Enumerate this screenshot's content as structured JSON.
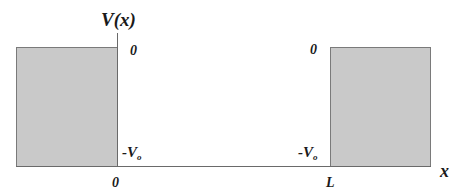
{
  "diagram": {
    "type": "finite square well potential",
    "y_axis_label": "V(x)",
    "x_axis_label": "x",
    "top_level_label_left": "0",
    "top_level_label_right": "0",
    "well_depth_label_left": "-V",
    "well_depth_label_right": "-V",
    "well_depth_subscript": "o",
    "x_tick_left": "0",
    "x_tick_right": "L",
    "colors": {
      "barrier_fill": "#c9c9c9",
      "barrier_border": "#7a7a7a",
      "axis": "#6a6a6a",
      "text": "#1a1a1a"
    }
  }
}
